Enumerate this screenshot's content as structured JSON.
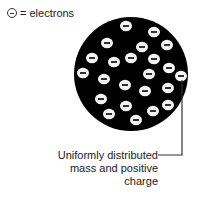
{
  "legend": {
    "symbol": "electron-symbol",
    "label": "= electrons"
  },
  "caption": {
    "line1": "Uniformly distributed",
    "line2": "mass and positive",
    "line3": "charge"
  },
  "model": {
    "name": "plum pudding model",
    "electron_count": 23
  }
}
